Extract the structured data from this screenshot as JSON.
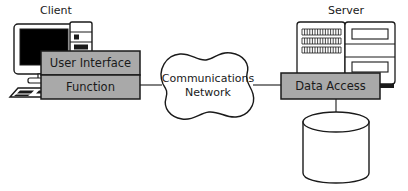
{
  "diagram": {
    "type": "architecture-diagram",
    "background_color": "#ffffff",
    "stroke_color": "#1a1a1a",
    "box_fill_color": "#a9a9a9",
    "screen_fill_color": "#000000",
    "cloud_fill_color": "#ffffff",
    "cylinder_fill_color": "#ffffff"
  },
  "client": {
    "label": "Client",
    "tiers": [
      {
        "label": "User Interface"
      },
      {
        "label": "Function"
      }
    ]
  },
  "network": {
    "line1": "Communications",
    "line2": "Network"
  },
  "server": {
    "label": "Server",
    "tiers": [
      {
        "label": "Data Access"
      }
    ]
  },
  "database": {
    "label": ""
  }
}
